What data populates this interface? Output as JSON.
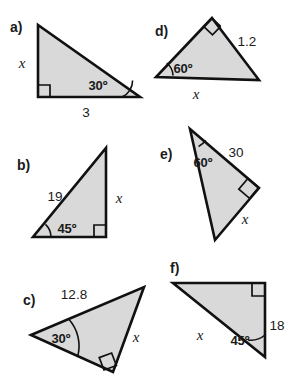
{
  "page": {
    "background_color": "#ffffff",
    "triangle_fill": "#d9d9d9",
    "triangle_stroke": "#111111",
    "text_color": "#1a1a1a",
    "width": 288,
    "height": 380
  },
  "problems": [
    {
      "id": "a",
      "label": "a)",
      "label_pos": {
        "x": 10,
        "y": 32
      },
      "vertices": [
        {
          "x": 38,
          "y": 25
        },
        {
          "x": 38,
          "y": 97
        },
        {
          "x": 140,
          "y": 97
        }
      ],
      "right_angle_at": {
        "x": 38,
        "y": 97
      },
      "marked_angle": {
        "value": "30º",
        "at": {
          "x": 140,
          "y": 97
        }
      },
      "labels": [
        {
          "name": "side-x",
          "text": "x",
          "kind": "variable",
          "x": 22,
          "y": 68
        },
        {
          "name": "side-3",
          "text": "3",
          "kind": "number",
          "x": 86,
          "y": 117
        },
        {
          "name": "angle-30",
          "text": "30º",
          "kind": "angle",
          "x": 98,
          "y": 90
        }
      ]
    },
    {
      "id": "b",
      "label": "b)",
      "label_pos": {
        "x": 17,
        "y": 165
      },
      "vertices": [
        {
          "x": 106,
          "y": 148
        },
        {
          "x": 106,
          "y": 237
        },
        {
          "x": 33,
          "y": 237
        }
      ],
      "right_angle_at": {
        "x": 106,
        "y": 237
      },
      "marked_angle": {
        "value": "45º",
        "at": {
          "x": 33,
          "y": 237
        }
      },
      "labels": [
        {
          "name": "side-19",
          "text": "19",
          "kind": "number",
          "x": 48,
          "y": 196
        },
        {
          "name": "side-x",
          "text": "x",
          "kind": "variable",
          "x": 117,
          "y": 198
        },
        {
          "name": "angle-45",
          "text": "45º",
          "kind": "angle",
          "x": 52,
          "y": 230
        }
      ]
    },
    {
      "id": "c",
      "label": "c)",
      "label_pos": {
        "x": 23,
        "y": 300
      },
      "vertices": [
        {
          "x": 31,
          "y": 335
        },
        {
          "x": 144,
          "y": 287
        },
        {
          "x": 113,
          "y": 372
        }
      ],
      "right_angle_at": {
        "x": 113,
        "y": 372
      },
      "marked_angle": {
        "value": "30º",
        "at": {
          "x": 31,
          "y": 335
        }
      },
      "labels": [
        {
          "name": "side-12-8",
          "text": "12.8",
          "kind": "number",
          "x": 61,
          "y": 294
        },
        {
          "name": "side-x",
          "text": "x",
          "kind": "variable",
          "x": 134,
          "y": 338
        },
        {
          "name": "angle-30",
          "text": "30º",
          "kind": "angle",
          "x": 49,
          "y": 340
        }
      ]
    },
    {
      "id": "d",
      "label": "d)",
      "label_pos": {
        "x": 155,
        "y": 30
      },
      "vertices": [
        {
          "x": 212,
          "y": 18
        },
        {
          "x": 156,
          "y": 77
        },
        {
          "x": 259,
          "y": 80
        }
      ],
      "right_angle_at": {
        "x": 212,
        "y": 18
      },
      "marked_angle": {
        "value": "60º",
        "at": {
          "x": 156,
          "y": 77
        }
      },
      "labels": [
        {
          "name": "side-1-2",
          "text": "1.2",
          "kind": "number",
          "x": 238,
          "y": 42
        },
        {
          "name": "side-x",
          "text": "x",
          "kind": "variable",
          "x": 196,
          "y": 97
        },
        {
          "name": "angle-60",
          "text": "60º",
          "kind": "angle",
          "x": 171,
          "y": 70
        }
      ]
    },
    {
      "id": "e",
      "label": "e)",
      "label_pos": {
        "x": 160,
        "y": 154
      },
      "vertices": [
        {
          "x": 190,
          "y": 129
        },
        {
          "x": 259,
          "y": 188
        },
        {
          "x": 215,
          "y": 240
        }
      ],
      "right_angle_at": {
        "x": 259,
        "y": 188
      },
      "marked_angle": {
        "value": "60º",
        "at": {
          "x": 190,
          "y": 129
        }
      },
      "labels": [
        {
          "name": "side-30",
          "text": "30",
          "kind": "number",
          "x": 228,
          "y": 152
        },
        {
          "name": "side-x",
          "text": "x",
          "kind": "variable",
          "x": 243,
          "y": 219
        },
        {
          "name": "angle-60",
          "text": "60º",
          "kind": "angle",
          "x": 191,
          "y": 163
        }
      ]
    },
    {
      "id": "f",
      "label": "f)",
      "label_pos": {
        "x": 170,
        "y": 268
      },
      "vertices": [
        {
          "x": 173,
          "y": 283
        },
        {
          "x": 265,
          "y": 283
        },
        {
          "x": 265,
          "y": 357
        }
      ],
      "right_angle_at": {
        "x": 265,
        "y": 283
      },
      "marked_angle": {
        "value": "45º",
        "at": {
          "x": 265,
          "y": 357
        }
      },
      "labels": [
        {
          "name": "side-18",
          "text": "18",
          "kind": "number",
          "x": 270,
          "y": 325
        },
        {
          "name": "side-x",
          "text": "x",
          "kind": "variable",
          "x": 200,
          "y": 337
        },
        {
          "name": "angle-45",
          "text": "45º",
          "kind": "angle",
          "x": 228,
          "y": 341
        }
      ]
    }
  ]
}
